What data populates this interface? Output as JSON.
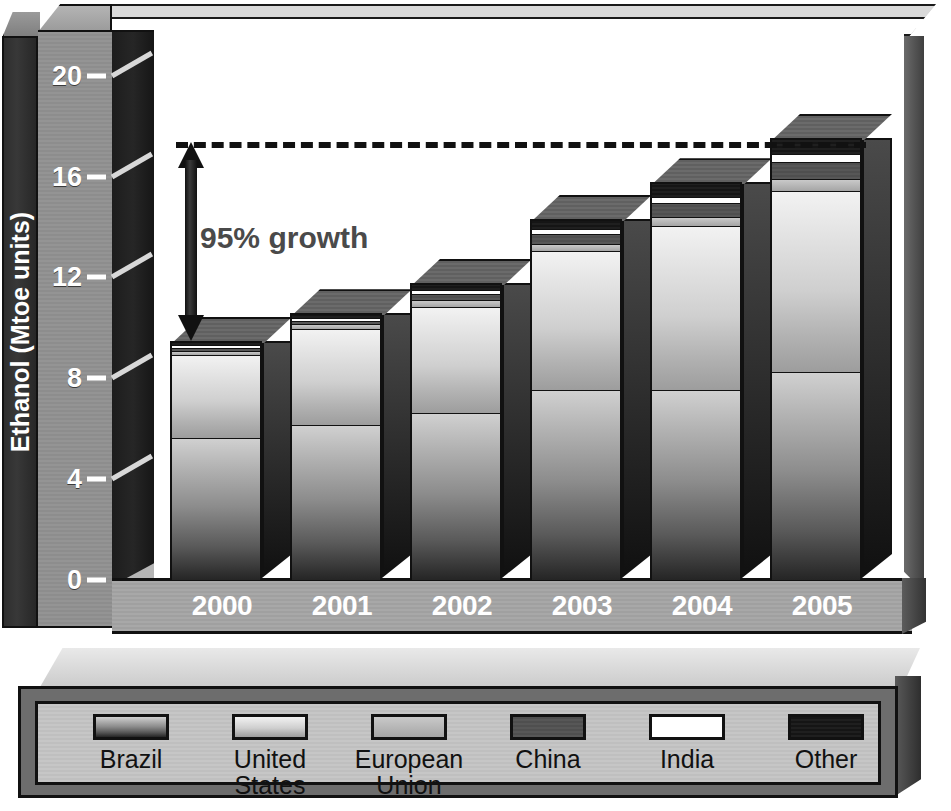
{
  "axis": {
    "y_title": "Ethanol (Mtoe units)",
    "y_ticks": [
      "0",
      "4",
      "8",
      "12",
      "16",
      "20"
    ]
  },
  "annotation": {
    "growth_label": "95% growth",
    "dashed_line_value": 17.3
  },
  "legend": {
    "items": [
      {
        "label": "Brazil",
        "fill": "f-brazil",
        "color": "#8c8c8c"
      },
      {
        "label": "United\nStates",
        "label_line1": "United",
        "label_line2": "States",
        "fill": "f-us",
        "color": "#cfcfcf"
      },
      {
        "label": "European\nUnion",
        "label_line1": "European",
        "label_line2": "Union",
        "fill": "f-eu",
        "color": "#b4b4b4"
      },
      {
        "label": "China",
        "fill": "f-china",
        "color": "#525252"
      },
      {
        "label": "India",
        "fill": "f-india",
        "color": "#ffffff"
      },
      {
        "label": "Other",
        "fill": "f-other",
        "color": "#1a1a1a"
      }
    ]
  },
  "chart_data": {
    "type": "bar",
    "subtype": "stacked-3d-column",
    "title": "",
    "xlabel": "",
    "ylabel": "Ethanol (Mtoe units)",
    "ylim": [
      0,
      21.5
    ],
    "ytick_step": 4,
    "grid": false,
    "legend_position": "bottom",
    "categories": [
      "2000",
      "2001",
      "2002",
      "2003",
      "2004",
      "2005"
    ],
    "series": [
      {
        "name": "Brazil",
        "values": [
          5.6,
          6.1,
          6.6,
          7.5,
          7.5,
          8.2
        ]
      },
      {
        "name": "United States",
        "values": [
          3.3,
          3.8,
          4.2,
          5.5,
          6.5,
          7.2
        ]
      },
      {
        "name": "European Union",
        "values": [
          0.15,
          0.2,
          0.25,
          0.3,
          0.35,
          0.45
        ]
      },
      {
        "name": "China",
        "values": [
          0.1,
          0.15,
          0.25,
          0.4,
          0.55,
          0.7
        ]
      },
      {
        "name": "India",
        "values": [
          0.15,
          0.1,
          0.15,
          0.2,
          0.25,
          0.3
        ]
      },
      {
        "name": "Other",
        "values": [
          0.1,
          0.15,
          0.25,
          0.35,
          0.55,
          0.6
        ]
      }
    ],
    "totals": [
      9.4,
      10.5,
      11.7,
      14.25,
      15.7,
      17.45
    ],
    "annotations": [
      {
        "text": "95% growth",
        "from_value": 9.4,
        "to_value": 17.3
      }
    ]
  }
}
